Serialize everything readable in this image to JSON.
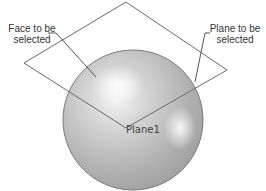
{
  "labels": {
    "face_callout": [
      "Face to be",
      "selected"
    ],
    "plane_callout": [
      "Plane to be",
      "selected"
    ],
    "plane_name": "Plane1"
  },
  "colors": {
    "sphere_edge": "#7a7a7a",
    "sphere_fill": "#b4b4b4",
    "highlight": "#f2f2f2",
    "plane_edge": "#6a6a6a",
    "leader": "#555555",
    "text": "#333333"
  }
}
